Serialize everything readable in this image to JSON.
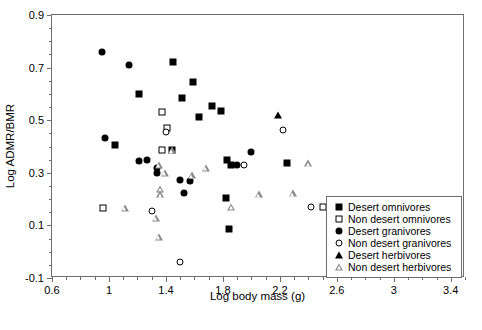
{
  "chart_data": {
    "type": "scatter",
    "title": "",
    "xlabel": "Log body mass (g)",
    "ylabel": "Log ADMR/BMR",
    "xlim": [
      0.6,
      3.5
    ],
    "ylim": [
      -0.1,
      0.9
    ],
    "grid": false,
    "legend_position": "bottom-right",
    "xticks": [
      0.6,
      1.0,
      1.4,
      1.8,
      2.2,
      2.6,
      3.0,
      3.4
    ],
    "xtick_labels": [
      "0.6",
      "1",
      "1.4",
      "1.8",
      "2.2",
      "2.6",
      "3",
      "3.4"
    ],
    "xtick_minor_step": 0.1,
    "yticks": [
      -0.1,
      0.1,
      0.3,
      0.5,
      0.7,
      0.9
    ],
    "ytick_labels": [
      "-0.1",
      "0.1",
      "0.3",
      "0.5",
      "0.7",
      "0.9"
    ],
    "ytick_minor_step": 0.05,
    "series": [
      {
        "name": "Desert omnivores",
        "marker": "filled-square",
        "points": [
          [
            1.04,
            0.405
          ],
          [
            1.21,
            0.6
          ],
          [
            1.45,
            0.722
          ],
          [
            1.51,
            0.583
          ],
          [
            1.59,
            0.645
          ],
          [
            1.63,
            0.512
          ],
          [
            1.72,
            0.555
          ],
          [
            1.79,
            0.535
          ],
          [
            1.44,
            0.388
          ],
          [
            1.83,
            0.348
          ],
          [
            1.86,
            0.33
          ],
          [
            2.25,
            0.336
          ],
          [
            1.82,
            0.205
          ],
          [
            1.84,
            0.088
          ]
        ]
      },
      {
        "name": "Non desert omnivores",
        "marker": "open-square",
        "points": [
          [
            1.37,
            0.53
          ],
          [
            1.41,
            0.47
          ],
          [
            1.37,
            0.387
          ],
          [
            0.96,
            0.168
          ],
          [
            2.5,
            0.17
          ]
        ]
      },
      {
        "name": "Desert granivores",
        "marker": "filled-circle",
        "points": [
          [
            0.95,
            0.76
          ],
          [
            1.14,
            0.71
          ],
          [
            0.97,
            0.432
          ],
          [
            1.21,
            0.345
          ],
          [
            1.27,
            0.348
          ],
          [
            1.34,
            0.318
          ],
          [
            1.34,
            0.3
          ],
          [
            1.5,
            0.273
          ],
          [
            1.57,
            0.268
          ],
          [
            1.9,
            0.33
          ],
          [
            1.53,
            0.222
          ],
          [
            2.0,
            0.378
          ]
        ]
      },
      {
        "name": "Non desert granivores",
        "marker": "open-circle",
        "points": [
          [
            1.4,
            0.455
          ],
          [
            2.22,
            0.462
          ],
          [
            1.95,
            0.33
          ],
          [
            1.3,
            0.155
          ],
          [
            1.5,
            -0.038
          ],
          [
            2.42,
            0.17
          ]
        ]
      },
      {
        "name": "Desert herbivores",
        "marker": "filled-triangle",
        "points": [
          [
            2.19,
            0.518
          ]
        ]
      },
      {
        "name": "Non desert herbivores",
        "marker": "open-triangle",
        "points": [
          [
            1.35,
            0.33
          ],
          [
            1.39,
            0.3
          ],
          [
            1.44,
            0.385
          ],
          [
            1.58,
            0.29
          ],
          [
            1.68,
            0.318
          ],
          [
            1.36,
            0.238
          ],
          [
            1.36,
            0.218
          ],
          [
            1.11,
            0.168
          ],
          [
            1.33,
            0.13
          ],
          [
            1.86,
            0.17
          ],
          [
            1.35,
            0.055
          ],
          [
            2.05,
            0.218
          ],
          [
            2.29,
            0.222
          ],
          [
            2.62,
            0.17
          ],
          [
            2.4,
            0.336
          ]
        ]
      }
    ]
  },
  "axes": {
    "x_title": "Log body mass (g)",
    "y_title": "Log ADMR/BMR"
  },
  "legend": {
    "items": [
      {
        "label": "Desert omnivores",
        "marker": "filled-square"
      },
      {
        "label": "Non desert omnivores",
        "marker": "open-square"
      },
      {
        "label": "Desert granivores",
        "marker": "filled-circle"
      },
      {
        "label": "Non desert granivores",
        "marker": "open-circle"
      },
      {
        "label": "Desert herbivores",
        "marker": "filled-triangle"
      },
      {
        "label": "Non desert herbivores",
        "marker": "open-triangle"
      }
    ]
  }
}
